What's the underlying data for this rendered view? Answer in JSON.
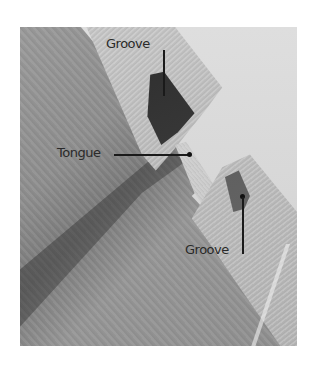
{
  "figure": {
    "labels": [
      {
        "id": "groove-top",
        "text": "Groove"
      },
      {
        "id": "tongue",
        "text": "Tongue"
      },
      {
        "id": "groove-bottom",
        "text": "Groove"
      }
    ]
  },
  "colors": {
    "background": "#ffffff",
    "label_text": "#2a2a2a",
    "leader_line": "#1a1a1a"
  }
}
